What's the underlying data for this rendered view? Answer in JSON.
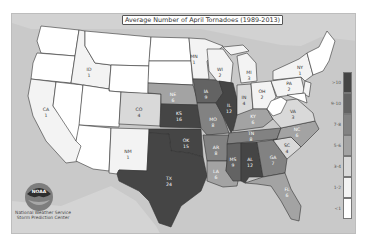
{
  "map": {
    "title": "Average Number of April Tornadoes (1989-2013)",
    "credit_line1": "National Weather Service",
    "credit_line2": "Storm Prediction Center",
    "logo_text": "NOAA",
    "colors": {
      "background_water": "#c9c9c9",
      "bin_lt1": "#ffffff",
      "bin_1_2": "#f3f3f3",
      "bin_3_4": "#d9d9d9",
      "bin_5_6": "#a3a3a3",
      "bin_7_8": "#828282",
      "bin_9_10": "#636363",
      "bin_gt10": "#454545"
    }
  },
  "legend": {
    "items": [
      {
        "label": ">10",
        "color": "#454545"
      },
      {
        "label": "9-10",
        "color": "#636363"
      },
      {
        "label": "7-8",
        "color": "#828282"
      },
      {
        "label": "5-6",
        "color": "#a3a3a3"
      },
      {
        "label": "3-4",
        "color": "#d9d9d9"
      },
      {
        "label": "1-2",
        "color": "#f3f3f3"
      },
      {
        "label": "<1",
        "color": "#ffffff"
      }
    ]
  },
  "states": [
    {
      "abbr": "CA",
      "value": "1"
    },
    {
      "abbr": "ID",
      "value": "1"
    },
    {
      "abbr": "CO",
      "value": "4"
    },
    {
      "abbr": "NM",
      "value": "1"
    },
    {
      "abbr": "NE",
      "value": "6"
    },
    {
      "abbr": "KS",
      "value": "16"
    },
    {
      "abbr": "OK",
      "value": "15"
    },
    {
      "abbr": "TX",
      "value": "24"
    },
    {
      "abbr": "MN",
      "value": "1"
    },
    {
      "abbr": "WI",
      "value": "2"
    },
    {
      "abbr": "IA",
      "value": "9"
    },
    {
      "abbr": "MO",
      "value": "8"
    },
    {
      "abbr": "AR",
      "value": "8"
    },
    {
      "abbr": "LA",
      "value": "6"
    },
    {
      "abbr": "IL",
      "value": "12"
    },
    {
      "abbr": "MI",
      "value": "3"
    },
    {
      "abbr": "IN",
      "value": "4"
    },
    {
      "abbr": "OH",
      "value": "2"
    },
    {
      "abbr": "KY",
      "value": "6"
    },
    {
      "abbr": "TN",
      "value": "8"
    },
    {
      "abbr": "MS",
      "value": "9"
    },
    {
      "abbr": "AL",
      "value": "12"
    },
    {
      "abbr": "GA",
      "value": "7"
    },
    {
      "abbr": "FL",
      "value": "6"
    },
    {
      "abbr": "SC",
      "value": "4"
    },
    {
      "abbr": "NC",
      "value": "6"
    },
    {
      "abbr": "VA",
      "value": "3"
    },
    {
      "abbr": "PA",
      "value": "2"
    },
    {
      "abbr": "NY",
      "value": "1"
    }
  ]
}
